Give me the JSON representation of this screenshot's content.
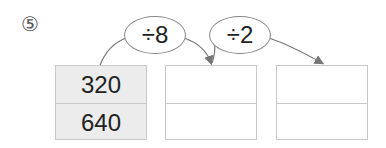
{
  "problem_number": "⑤",
  "operations": [
    {
      "label": "÷8"
    },
    {
      "label": "÷2"
    }
  ],
  "boxes": [
    {
      "cells": [
        "320",
        "640"
      ],
      "filled": true
    },
    {
      "cells": [
        "",
        ""
      ],
      "filled": false
    },
    {
      "cells": [
        "",
        ""
      ],
      "filled": false
    }
  ],
  "colors": {
    "filled_box": "#ececec",
    "border": "#c8c8c8",
    "arrow": "#777777",
    "text": "#222222"
  }
}
